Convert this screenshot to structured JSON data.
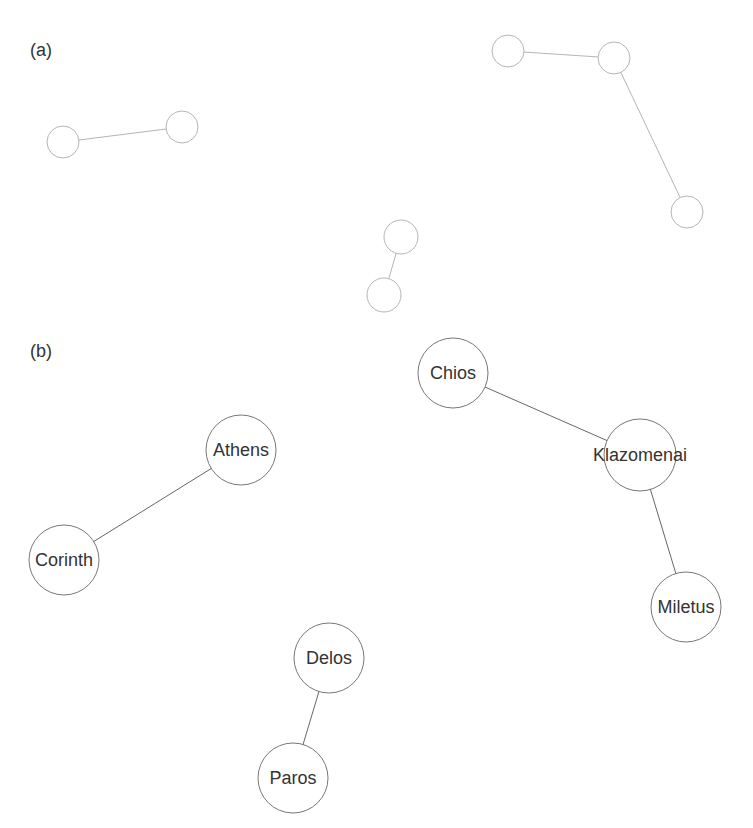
{
  "panels": {
    "a": {
      "label": "(a)",
      "nodes": [
        {
          "id": "a1",
          "x": 63,
          "y": 142,
          "r": 16
        },
        {
          "id": "a2",
          "x": 182,
          "y": 127,
          "r": 16
        },
        {
          "id": "a3",
          "x": 508,
          "y": 51,
          "r": 16
        },
        {
          "id": "a4",
          "x": 614,
          "y": 58,
          "r": 16
        },
        {
          "id": "a5",
          "x": 687,
          "y": 212,
          "r": 16
        },
        {
          "id": "a6",
          "x": 401,
          "y": 237,
          "r": 17
        },
        {
          "id": "a7",
          "x": 384,
          "y": 295,
          "r": 17
        }
      ],
      "edges": [
        [
          "a1",
          "a2"
        ],
        [
          "a3",
          "a4"
        ],
        [
          "a4",
          "a5"
        ],
        [
          "a6",
          "a7"
        ]
      ]
    },
    "b": {
      "label": "(b)",
      "nodes": [
        {
          "id": "athens",
          "label": "Athens",
          "x": 241,
          "y": 450,
          "r": 35
        },
        {
          "id": "corinth",
          "label": "Corinth",
          "x": 64,
          "y": 560,
          "r": 35
        },
        {
          "id": "chios",
          "label": "Chios",
          "x": 453,
          "y": 373,
          "r": 35
        },
        {
          "id": "klazomenai",
          "label": "Klazomenai",
          "x": 640,
          "y": 455,
          "r": 36
        },
        {
          "id": "miletus",
          "label": "Miletus",
          "x": 686,
          "y": 607,
          "r": 35
        },
        {
          "id": "delos",
          "label": "Delos",
          "x": 329,
          "y": 658,
          "r": 35
        },
        {
          "id": "paros",
          "label": "Paros",
          "x": 293,
          "y": 778,
          "r": 35
        }
      ],
      "edges": [
        [
          "athens",
          "corinth"
        ],
        [
          "chios",
          "klazomenai"
        ],
        [
          "klazomenai",
          "miletus"
        ],
        [
          "delos",
          "paros"
        ]
      ]
    }
  },
  "colors": {
    "edge_a": "#b5b5b5",
    "edge_b": "#666666",
    "text": "#333333"
  }
}
